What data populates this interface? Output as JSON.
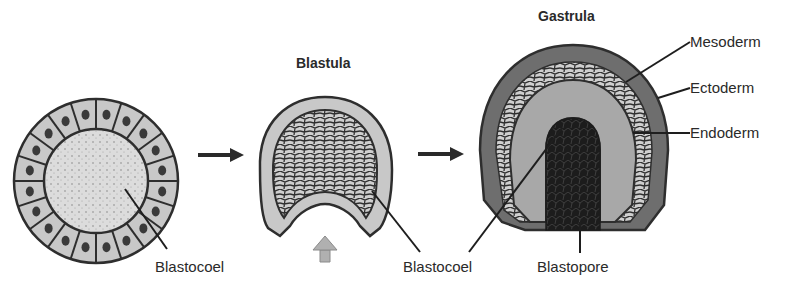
{
  "titles": {
    "blastula": "Blastula",
    "gastrula": "Gastrula"
  },
  "labels": {
    "blastocoel_1": "Blastocoel",
    "blastocoel_2": "Blastocoel",
    "blastopore": "Blastopore",
    "mesoderm": "Mesoderm",
    "ectoderm": "Ectoderm",
    "endoderm": "Endoderm"
  },
  "colors": {
    "cell_fill": "#c8c8c8",
    "cell_stroke": "#2e2e2e",
    "blastocoel_fill": "#dcdcdc",
    "ectoderm_fill": "#6e6e6e",
    "endoderm_fill": "#a8a8a8",
    "gut_fill": "#1c1c1c",
    "arrow": "#2a2a2a",
    "invagination_arrow": "#b0b0b0"
  }
}
